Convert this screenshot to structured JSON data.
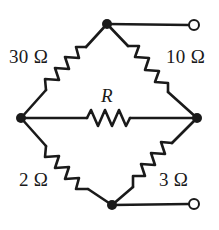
{
  "figure": {
    "type": "circuit-diagram",
    "width": 219,
    "height": 230,
    "background_color": "#ffffff",
    "line_color": "#1a1a1a"
  },
  "labels": {
    "top_left": "30 Ω",
    "top_right": "10 Ω",
    "bottom_left": "2 Ω",
    "bottom_right": "3 Ω",
    "bridge": "R"
  },
  "components": [
    {
      "id": "r-top-left",
      "label": "30 Ω",
      "value": "30",
      "unit": "Ω",
      "position": "upper-left arm"
    },
    {
      "id": "r-top-right",
      "label": "10 Ω",
      "value": "10",
      "unit": "Ω",
      "position": "upper-right arm"
    },
    {
      "id": "r-bottom-left",
      "label": "2 Ω",
      "value": "2",
      "unit": "Ω",
      "position": "lower-left arm"
    },
    {
      "id": "r-bottom-right",
      "label": "3 Ω",
      "value": "3",
      "unit": "Ω",
      "position": "lower-right arm"
    },
    {
      "id": "r-bridge",
      "label": "R",
      "value": "R",
      "unit": "",
      "position": "horizontal bridge"
    }
  ],
  "nodes": [
    {
      "id": "node-top",
      "x": 107,
      "y": 24,
      "type": "junction"
    },
    {
      "id": "node-left",
      "x": 21,
      "y": 118,
      "type": "junction"
    },
    {
      "id": "node-right",
      "x": 197,
      "y": 118,
      "type": "junction"
    },
    {
      "id": "node-bottom",
      "x": 112,
      "y": 205,
      "type": "junction"
    }
  ],
  "terminals": [
    {
      "id": "terminal-top",
      "x": 194,
      "y": 25,
      "radius": 5,
      "type": "open-circle"
    },
    {
      "id": "terminal-bottom",
      "x": 194,
      "y": 204,
      "radius": 5,
      "type": "open-circle"
    }
  ]
}
